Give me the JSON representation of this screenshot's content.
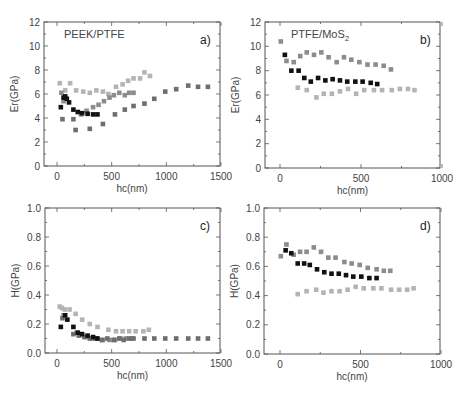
{
  "figure": {
    "panels": [
      {
        "id": "a",
        "tag": "a)",
        "title": "PEEK/PTFE",
        "title_sub": "",
        "xlabel": "hc(nm)",
        "ylabel": "Er(GPa)"
      },
      {
        "id": "b",
        "tag": "b)",
        "title": "PTFE/MoS",
        "title_sub": "2",
        "xlabel": "hc(nm)",
        "ylabel": "Er(GPa)"
      },
      {
        "id": "c",
        "tag": "c)",
        "title": "",
        "title_sub": "",
        "xlabel": "hc(nm)",
        "ylabel": "H(GPa)"
      },
      {
        "id": "d",
        "tag": "d)",
        "title": "",
        "title_sub": "",
        "xlabel": "hc(nm)",
        "ylabel": "H(GPa)"
      }
    ]
  },
  "colors": {
    "series_black": "#111111",
    "series_dark_gray": "#6e6e6e",
    "series_mid_gray": "#8c8c8c",
    "series_light_gray": "#b4b4b4",
    "axis": "#555555"
  },
  "chart_data": [
    {
      "panel": "a",
      "type": "scatter",
      "title": "PEEK/PTFE",
      "annotation": "a)",
      "xlabel": "hc(nm)",
      "ylabel": "Er(GPa)",
      "xlim": [
        -80,
        1500
      ],
      "ylim": [
        0,
        12
      ],
      "xticks": [
        0,
        500,
        1000,
        1500
      ],
      "yticks": [
        0,
        2,
        4,
        6,
        8,
        10,
        12
      ],
      "grid": false,
      "series": [
        {
          "name": "black",
          "color": "#111111",
          "x": [
            35,
            60,
            75,
            90,
            110,
            150,
            190,
            230,
            280,
            330,
            370
          ],
          "y": [
            4.9,
            5.7,
            5.8,
            5.6,
            5.3,
            4.7,
            4.5,
            4.4,
            4.35,
            4.3,
            4.3
          ]
        },
        {
          "name": "dark_gray",
          "color": "#6e6e6e",
          "x": [
            50,
            150,
            170,
            300,
            420,
            530,
            620,
            700,
            800,
            890,
            990,
            1090,
            1200,
            1290,
            1380
          ],
          "y": [
            3.9,
            3.9,
            3.0,
            3.1,
            3.5,
            4.3,
            4.7,
            5.0,
            5.2,
            5.6,
            6.2,
            6.4,
            6.7,
            6.6,
            6.6
          ]
        },
        {
          "name": "mid_gray",
          "color": "#8c8c8c",
          "x": [
            40,
            60,
            220,
            270,
            330,
            380,
            430,
            480,
            520,
            570,
            620,
            660,
            700
          ],
          "y": [
            6.1,
            5.4,
            4.3,
            4.6,
            4.9,
            5.1,
            5.4,
            5.7,
            5.9,
            6.1,
            5.9,
            6.1,
            6.1
          ]
        },
        {
          "name": "light_gray",
          "color": "#b4b4b4",
          "x": [
            25,
            75,
            120,
            175,
            240,
            300,
            360,
            420,
            470,
            540,
            600,
            650,
            700,
            760,
            800,
            850
          ],
          "y": [
            6.9,
            6.3,
            6.9,
            6.3,
            6.2,
            6.1,
            6.3,
            6.2,
            6.0,
            6.6,
            6.8,
            7.1,
            7.3,
            7.3,
            7.8,
            7.5
          ]
        }
      ]
    },
    {
      "panel": "b",
      "type": "scatter",
      "title": "PTFE/MoS2",
      "annotation": "b)",
      "xlabel": "hc(nm)",
      "ylabel": "Er(GPa)",
      "xlim": [
        -90,
        1000
      ],
      "ylim": [
        0,
        12
      ],
      "xticks": [
        0,
        500,
        1000
      ],
      "yticks": [
        0,
        2,
        4,
        6,
        8,
        10,
        12
      ],
      "grid": false,
      "series": [
        {
          "name": "black",
          "color": "#111111",
          "x": [
            30,
            70,
            115,
            150,
            190,
            235,
            280,
            325,
            370,
            415,
            465,
            510,
            560,
            600
          ],
          "y": [
            9.3,
            8.0,
            8.0,
            7.4,
            7.1,
            7.4,
            7.2,
            7.3,
            7.2,
            7.1,
            7.1,
            7.1,
            7.0,
            6.9
          ]
        },
        {
          "name": "mid_gray",
          "color": "#8c8c8c",
          "x": [
            5,
            40,
            85,
            125,
            165,
            210,
            255,
            300,
            350,
            395,
            440,
            490,
            540,
            590,
            640,
            685
          ],
          "y": [
            10.4,
            8.8,
            8.7,
            9.2,
            9.5,
            9.3,
            9.5,
            9.1,
            8.7,
            9.1,
            8.9,
            8.7,
            8.5,
            8.5,
            8.4,
            8.1
          ]
        },
        {
          "name": "light_gray",
          "color": "#b4b4b4",
          "x": [
            110,
            165,
            225,
            270,
            320,
            370,
            420,
            470,
            520,
            580,
            630,
            690,
            740,
            790,
            830
          ],
          "y": [
            6.6,
            6.4,
            5.8,
            6.1,
            6.1,
            6.3,
            6.5,
            6.1,
            6.4,
            6.4,
            6.4,
            6.4,
            6.5,
            6.5,
            6.4
          ]
        }
      ]
    },
    {
      "panel": "c",
      "type": "scatter",
      "title": "",
      "annotation": "c)",
      "xlabel": "hc(nm)",
      "ylabel": "H(GPa)",
      "xlim": [
        -80,
        1500
      ],
      "ylim": [
        0,
        1.0
      ],
      "xticks": [
        0,
        500,
        1000,
        1500
      ],
      "yticks": [
        0.0,
        0.2,
        0.4,
        0.6,
        0.8,
        1.0
      ],
      "grid": false,
      "series": [
        {
          "name": "black",
          "color": "#111111",
          "x": [
            35,
            75,
            95,
            150,
            190,
            230,
            280,
            330,
            370
          ],
          "y": [
            0.18,
            0.26,
            0.23,
            0.18,
            0.14,
            0.13,
            0.12,
            0.11,
            0.1
          ]
        },
        {
          "name": "dark_gray",
          "color": "#6e6e6e",
          "x": [
            50,
            150,
            200,
            250,
            300,
            350,
            410,
            460,
            520,
            570,
            610,
            660,
            700,
            800,
            890,
            990,
            1090,
            1200,
            1290,
            1380
          ],
          "y": [
            0.24,
            0.13,
            0.12,
            0.11,
            0.1,
            0.1,
            0.09,
            0.1,
            0.09,
            0.1,
            0.09,
            0.1,
            0.1,
            0.1,
            0.1,
            0.1,
            0.1,
            0.1,
            0.1,
            0.1
          ]
        },
        {
          "name": "mid_gray",
          "color": "#8c8c8c",
          "x": [
            60,
            180,
            220,
            270,
            310,
            360,
            420,
            480,
            530,
            580,
            630,
            680
          ],
          "y": [
            0.26,
            0.14,
            0.13,
            0.11,
            0.1,
            0.1,
            0.09,
            0.09,
            0.09,
            0.1,
            0.1,
            0.1
          ]
        },
        {
          "name": "light_gray",
          "color": "#b4b4b4",
          "x": [
            25,
            45,
            70,
            115,
            170,
            230,
            300,
            370,
            470,
            540,
            600,
            660,
            720,
            790,
            840
          ],
          "y": [
            0.32,
            0.31,
            0.3,
            0.3,
            0.27,
            0.23,
            0.2,
            0.18,
            0.16,
            0.15,
            0.15,
            0.15,
            0.15,
            0.15,
            0.16
          ]
        }
      ]
    },
    {
      "panel": "d",
      "type": "scatter",
      "title": "",
      "annotation": "d)",
      "xlabel": "hc(nm)",
      "ylabel": "H(GPa)",
      "xlim": [
        -90,
        1000
      ],
      "ylim": [
        0,
        1.0
      ],
      "xticks": [
        0,
        500,
        1000
      ],
      "yticks": [
        0.0,
        0.2,
        0.4,
        0.6,
        0.8,
        1.0
      ],
      "grid": false,
      "series": [
        {
          "name": "black",
          "color": "#111111",
          "x": [
            35,
            70,
            110,
            150,
            185,
            230,
            275,
            320,
            365,
            410,
            455,
            505,
            555,
            600
          ],
          "y": [
            0.71,
            0.69,
            0.62,
            0.62,
            0.61,
            0.58,
            0.56,
            0.55,
            0.55,
            0.54,
            0.53,
            0.53,
            0.52,
            0.52
          ]
        },
        {
          "name": "mid_gray",
          "color": "#8c8c8c",
          "x": [
            5,
            40,
            85,
            125,
            165,
            210,
            255,
            300,
            345,
            400,
            445,
            495,
            545,
            600,
            645,
            685
          ],
          "y": [
            0.67,
            0.75,
            0.68,
            0.7,
            0.7,
            0.73,
            0.7,
            0.66,
            0.66,
            0.63,
            0.62,
            0.61,
            0.59,
            0.58,
            0.57,
            0.57
          ]
        },
        {
          "name": "light_gray",
          "color": "#b4b4b4",
          "x": [
            110,
            165,
            225,
            270,
            320,
            370,
            420,
            470,
            520,
            580,
            630,
            690,
            740,
            790,
            830
          ],
          "y": [
            0.41,
            0.43,
            0.44,
            0.42,
            0.43,
            0.43,
            0.44,
            0.46,
            0.45,
            0.45,
            0.45,
            0.44,
            0.44,
            0.44,
            0.45
          ]
        }
      ]
    }
  ]
}
